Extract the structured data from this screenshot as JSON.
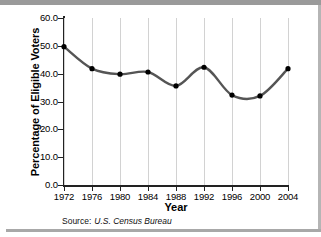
{
  "chart_data": {
    "type": "line",
    "title": "",
    "xlabel": "Year",
    "ylabel": "Percentage of Eligible Voters",
    "x": [
      1972,
      1976,
      1980,
      1984,
      1988,
      1992,
      1996,
      2000,
      2004
    ],
    "categories": [
      "1972",
      "1976",
      "1980",
      "1984",
      "1988",
      "1992",
      "1996",
      "2000",
      "2004"
    ],
    "values": [
      49.7,
      41.8,
      39.8,
      40.6,
      35.6,
      42.3,
      32.3,
      32.0,
      41.8
    ],
    "series": [
      {
        "name": "Percentage of Eligible Voters",
        "values": [
          49.7,
          41.8,
          39.8,
          40.6,
          35.6,
          42.3,
          32.3,
          32.0,
          41.8
        ]
      }
    ],
    "ylim": [
      0.0,
      60.0
    ],
    "ytick_step": 10.0,
    "ytick_labels": [
      "0.0",
      "10.0",
      "20.0",
      "30.0",
      "40.0",
      "50.0",
      "60.0"
    ],
    "ytick_values": [
      0.0,
      10.0,
      20.0,
      30.0,
      40.0,
      50.0,
      60.0
    ],
    "xlim": [
      1972,
      2004
    ],
    "xtick_step": 4,
    "grid": "vertical",
    "legend": "none",
    "interpolation": "smooth",
    "marker": "circle",
    "line_color": "#555555",
    "marker_color": "#000000",
    "grid_color": "#d2d2d2",
    "axis_color": "#222222",
    "background_color": "#ffffff"
  },
  "source": {
    "label": "Source:",
    "value": "U.S. Census Bureau"
  }
}
